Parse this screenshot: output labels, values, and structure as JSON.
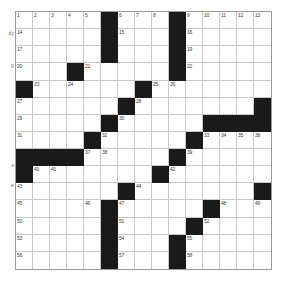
{
  "puzzle": {
    "type": "crossword-grid",
    "rows": 15,
    "cols": 15,
    "grid_colors": {
      "block": "#1a1a1a",
      "cell": "#ffffff",
      "gridline": "#c9c9c9",
      "border": "#9a9a9a",
      "number": "#404040"
    },
    "blocks": [
      [
        0,
        5
      ],
      [
        0,
        9
      ],
      [
        1,
        5
      ],
      [
        1,
        9
      ],
      [
        2,
        5
      ],
      [
        2,
        9
      ],
      [
        3,
        3
      ],
      [
        3,
        9
      ],
      [
        4,
        0
      ],
      [
        4,
        7
      ],
      [
        5,
        6
      ],
      [
        5,
        14
      ],
      [
        6,
        5
      ],
      [
        6,
        11
      ],
      [
        6,
        12
      ],
      [
        6,
        13
      ],
      [
        6,
        14
      ],
      [
        7,
        4
      ],
      [
        7,
        10
      ],
      [
        8,
        0
      ],
      [
        8,
        1
      ],
      [
        8,
        2
      ],
      [
        8,
        3
      ],
      [
        8,
        9
      ],
      [
        9,
        0
      ],
      [
        9,
        8
      ],
      [
        10,
        6
      ],
      [
        10,
        14
      ],
      [
        11,
        5
      ],
      [
        11,
        11
      ],
      [
        12,
        5
      ],
      [
        12,
        10
      ],
      [
        13,
        5
      ],
      [
        13,
        9
      ],
      [
        14,
        5
      ],
      [
        14,
        9
      ]
    ],
    "numbers": {
      "0_0": "1",
      "0_1": "2",
      "0_2": "3",
      "0_3": "4",
      "0_4": "5",
      "0_6": "6",
      "0_7": "7",
      "0_8": "8",
      "0_10": "9",
      "0_11": "10",
      "0_12": "11",
      "0_13": "12",
      "0_14": "13",
      "1_0": "14",
      "1_6": "15",
      "1_10": "16",
      "2_0": "17",
      "2_5": "18",
      "2_10": "19",
      "3_0": "20",
      "3_4": "21",
      "3_10": "22",
      "4_1": "23",
      "4_3": "24",
      "4_8": "25",
      "4_9": "26",
      "5_0": "27",
      "5_7": "28",
      "6_0": "29",
      "6_6": "30",
      "7_0": "31",
      "7_5": "32",
      "7_11": "33",
      "7_12": "34",
      "7_13": "35",
      "7_14": "36",
      "8_4": "37",
      "8_5": "38",
      "8_10": "39",
      "9_1": "40",
      "9_2": "41",
      "9_9": "42",
      "10_0": "43",
      "10_7": "44",
      "11_0": "45",
      "11_4": "46",
      "11_6": "47",
      "11_12": "48",
      "11_14": "49",
      "12_0": "50",
      "12_6": "51",
      "12_11": "52",
      "13_0": "53",
      "13_6": "54",
      "13_10": "55",
      "14_0": "56",
      "14_6": "57",
      "14_10": "58"
    }
  },
  "margin_clues": [
    {
      "text": "dy",
      "top": 30
    },
    {
      "text": "g",
      "top": 62
    },
    {
      "text": "s",
      "top": 162
    },
    {
      "text": "e",
      "top": 182
    }
  ]
}
